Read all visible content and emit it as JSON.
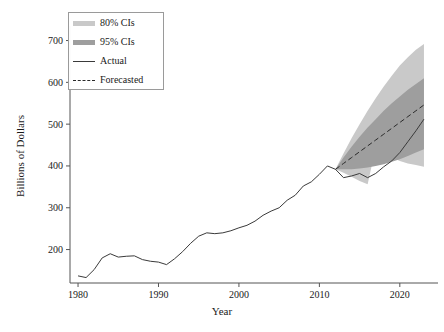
{
  "chart_data": {
    "type": "line",
    "title": "",
    "xlabel": "Year",
    "ylabel": "Billions of Dollars",
    "xlim": [
      1979,
      2024
    ],
    "ylim": [
      120,
      730
    ],
    "xticks": [
      1980,
      1990,
      2000,
      2010,
      2020
    ],
    "yticks": [
      200,
      300,
      400,
      500,
      600,
      700
    ],
    "grid": false,
    "legend_position": "top-left",
    "legend": [
      {
        "label": "80% CIs",
        "type": "band",
        "color": "#bfbfbf"
      },
      {
        "label": "95% CIs",
        "type": "band",
        "color": "#8f8f8f"
      },
      {
        "label": "Actual",
        "type": "line",
        "color": "#3a3a3a"
      },
      {
        "label": "Forecasted",
        "type": "dashed",
        "color": "#2a2a2a"
      }
    ],
    "series": [
      {
        "name": "Actual",
        "style": "solid",
        "color": "#3a3a3a",
        "x": [
          1980,
          1981,
          1982,
          1983,
          1984,
          1985,
          1986,
          1987,
          1988,
          1989,
          1990,
          1991,
          1992,
          1993,
          1994,
          1995,
          1996,
          1997,
          1998,
          1999,
          2000,
          2001,
          2002,
          2003,
          2004,
          2005,
          2006,
          2007,
          2008,
          2009,
          2010,
          2011,
          2012,
          2013,
          2014,
          2015,
          2016,
          2017,
          2018,
          2019,
          2020,
          2021,
          2022,
          2023
        ],
        "values": [
          137,
          133,
          152,
          180,
          190,
          182,
          184,
          185,
          176,
          172,
          170,
          164,
          178,
          195,
          215,
          232,
          240,
          238,
          240,
          245,
          252,
          258,
          268,
          282,
          292,
          300,
          318,
          330,
          352,
          362,
          380,
          400,
          392,
          372,
          376,
          382,
          372,
          382,
          398,
          412,
          432,
          458,
          484,
          512
        ]
      },
      {
        "name": "Forecasted",
        "style": "dashed",
        "color": "#2a2a2a",
        "x": [
          2012,
          2013,
          2014,
          2015,
          2016,
          2017,
          2018,
          2019,
          2020,
          2021,
          2022,
          2023
        ],
        "values": [
          392,
          406,
          420,
          434,
          448,
          462,
          476,
          490,
          504,
          518,
          532,
          546
        ]
      }
    ],
    "bands": [
      {
        "name": "95% CIs",
        "color": "#c9c9c9",
        "x": [
          2012,
          2013,
          2014,
          2015,
          2016,
          2017,
          2018,
          2019,
          2020,
          2021,
          2022,
          2023
        ],
        "lower": [
          392,
          384,
          374,
          364,
          356,
          444,
          430,
          420,
          412,
          406,
          402,
          398
        ],
        "upper": [
          392,
          430,
          466,
          500,
          532,
          562,
          590,
          616,
          640,
          660,
          678,
          692
        ]
      },
      {
        "name": "80% CIs",
        "color": "#9e9e9e",
        "x": [
          2012,
          2013,
          2014,
          2015,
          2016,
          2017,
          2018,
          2019,
          2020,
          2021,
          2022,
          2023
        ],
        "lower": [
          392,
          392,
          392,
          394,
          396,
          400,
          404,
          410,
          416,
          424,
          432,
          440
        ],
        "upper": [
          392,
          420,
          446,
          470,
          492,
          512,
          532,
          550,
          566,
          582,
          596,
          610
        ]
      }
    ]
  }
}
